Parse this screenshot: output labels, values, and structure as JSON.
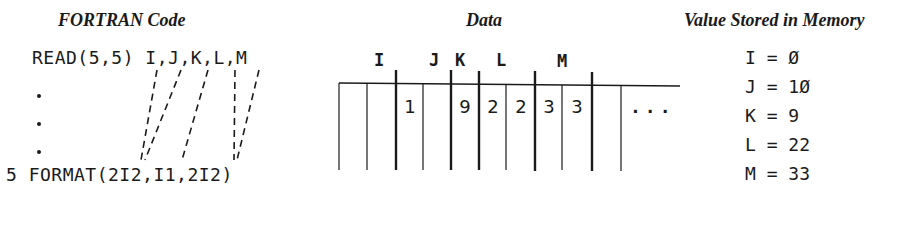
{
  "headings": {
    "code": "FORTRAN Code",
    "data": "Data",
    "memory": "Value Stored in Memory"
  },
  "code": {
    "read_stmt": "READ(5,5) I,J,K,L,M",
    "ellipsis_dots": 3,
    "format_stmt": "5 FORMAT(2I2,I1,2I2)"
  },
  "data_record": {
    "column_labels": [
      {
        "name": "I",
        "x": 378
      },
      {
        "name": "J",
        "x": 433
      },
      {
        "name": "K",
        "x": 459
      },
      {
        "name": "L",
        "x": 500
      },
      {
        "name": "M",
        "x": 561
      }
    ],
    "cells": [
      "",
      "",
      "1",
      "",
      "9",
      "2",
      "2",
      "3",
      "3",
      ""
    ],
    "continuation": "...",
    "field_widths": [
      2,
      2,
      1,
      2,
      2
    ]
  },
  "memory": [
    {
      "var": "I",
      "value": "Ø"
    },
    {
      "var": "J",
      "value": "1Ø"
    },
    {
      "var": "K",
      "value": "9"
    },
    {
      "var": "L",
      "value": "22"
    },
    {
      "var": "M",
      "value": "33"
    }
  ]
}
